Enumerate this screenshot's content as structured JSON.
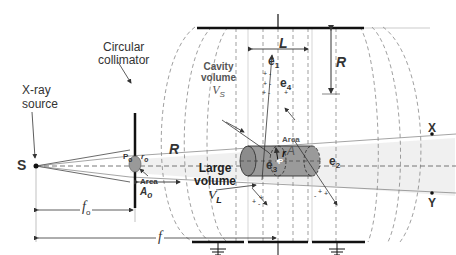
{
  "labels": {
    "xray_source_line1": "X-ray",
    "xray_source_line2": "source",
    "source_point": "S",
    "collimator_line1": "Circular",
    "collimator_line2": "collimator",
    "p0": "P",
    "p0_sub": "o",
    "r0": "r",
    "r0_sub": "o",
    "area0_line1": "Area",
    "area0_symbol": "A",
    "area0_sub": "o",
    "radius_lower": "R",
    "radius_upper": "R",
    "length": "L",
    "cavity_line1": "Cavity",
    "cavity_line2": "volume",
    "cavity_symbol": "V",
    "cavity_sub": "S",
    "large_line1": "Large",
    "large_line2": "volume",
    "large_symbol": "V",
    "large_sub": "L",
    "area_line1": "Area",
    "area_symbol": "A",
    "point_p": "P",
    "radius_r": "r",
    "e1": "e",
    "e1_sub": "1",
    "e2": "e",
    "e2_sub": "2",
    "e3": "e",
    "e3_sub": "3",
    "e4": "e",
    "e4_sub": "4",
    "point_x": "X",
    "point_y": "Y",
    "f0": "f",
    "f0_sub": "o",
    "f": "f"
  },
  "colors": {
    "line": "#333333",
    "dash": "#555555",
    "cavity_fill": "#9a9a9a",
    "beam_fill": "#ececec",
    "electrode": "#111111"
  }
}
